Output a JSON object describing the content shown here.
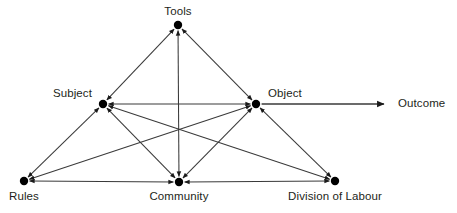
{
  "diagram": {
    "stroke_color": "#3a3a3a",
    "node_color": "#000000",
    "text_color": "#231f20",
    "background": "#ffffff",
    "nodes": [
      {
        "id": "tools",
        "label": "Tools",
        "x": 178,
        "y": 25,
        "label_x": 178,
        "label_y": 5,
        "label_pos": "above"
      },
      {
        "id": "subject",
        "label": "Subject",
        "x": 103,
        "y": 104,
        "label_x": 92,
        "label_y": 87,
        "label_pos": "left"
      },
      {
        "id": "object",
        "label": "Object",
        "x": 256,
        "y": 104,
        "label_x": 268,
        "label_y": 87,
        "label_pos": "right"
      },
      {
        "id": "rules",
        "label": "Rules",
        "x": 24,
        "y": 181,
        "label_x": 24,
        "label_y": 190,
        "label_pos": "below"
      },
      {
        "id": "community",
        "label": "Community",
        "x": 179,
        "y": 182,
        "label_x": 179,
        "label_y": 190,
        "label_pos": "below"
      },
      {
        "id": "division",
        "label": "Division of Labour",
        "x": 335,
        "y": 181,
        "label_x": 335,
        "label_y": 190,
        "label_pos": "below"
      },
      {
        "id": "outcome",
        "label": "Outcome",
        "x": 398,
        "y": 104,
        "label_x": 398,
        "label_y": 97,
        "label_pos": "right-terminal"
      }
    ],
    "edges": [
      {
        "from": "subject",
        "to": "tools",
        "type": "bidirectional"
      },
      {
        "from": "tools",
        "to": "object",
        "type": "bidirectional"
      },
      {
        "from": "subject",
        "to": "object",
        "type": "bidirectional"
      },
      {
        "from": "tools",
        "to": "community",
        "type": "bidirectional"
      },
      {
        "from": "subject",
        "to": "rules",
        "type": "bidirectional"
      },
      {
        "from": "subject",
        "to": "community",
        "type": "bidirectional"
      },
      {
        "from": "subject",
        "to": "division",
        "type": "bidirectional"
      },
      {
        "from": "object",
        "to": "rules",
        "type": "bidirectional"
      },
      {
        "from": "object",
        "to": "community",
        "type": "bidirectional"
      },
      {
        "from": "object",
        "to": "division",
        "type": "bidirectional"
      },
      {
        "from": "rules",
        "to": "community",
        "type": "bidirectional"
      },
      {
        "from": "community",
        "to": "division",
        "type": "bidirectional"
      },
      {
        "from": "object",
        "to": "outcome",
        "type": "unidirectional"
      }
    ]
  }
}
